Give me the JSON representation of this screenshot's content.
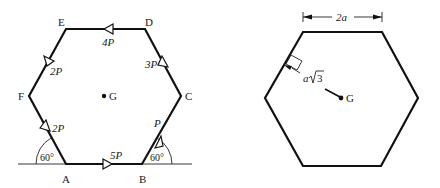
{
  "left_figure": {
    "vertices": [
      {
        "name": "A",
        "label": "A"
      },
      {
        "name": "B",
        "label": "B"
      },
      {
        "name": "C",
        "label": "C"
      },
      {
        "name": "D",
        "label": "D"
      },
      {
        "name": "E",
        "label": "E"
      },
      {
        "name": "F",
        "label": "F"
      }
    ],
    "forces": [
      {
        "edge": "AB",
        "label": "5P"
      },
      {
        "edge": "BC",
        "label": "P"
      },
      {
        "edge": "CD",
        "label": "3P"
      },
      {
        "edge": "DE",
        "label": "4P"
      },
      {
        "edge": "EF",
        "label": "2P"
      },
      {
        "edge": "FA",
        "label": "2P"
      }
    ],
    "angles": [
      {
        "at": "A",
        "label": "60°"
      },
      {
        "at": "B",
        "label": "60°"
      }
    ],
    "centroid_label": "G"
  },
  "right_figure": {
    "width_dimension": "2a",
    "apothem_label_prefix": "a",
    "apothem_label_root": "3",
    "centroid_label": "G"
  }
}
